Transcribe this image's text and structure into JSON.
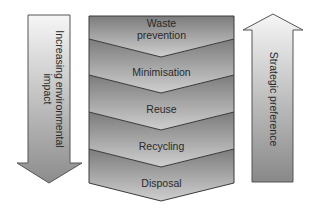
{
  "left_arrow": {
    "direction": "down",
    "label_line1": "Increasing environmental",
    "label_line2": "impact",
    "gradient": [
      "#f6f6f6",
      "#8c8c8c"
    ],
    "stroke": "#555555"
  },
  "right_arrow": {
    "direction": "up",
    "label": "Strategic preference",
    "gradient": [
      "#f6f6f6",
      "#888888"
    ],
    "stroke": "#555555"
  },
  "hierarchy": {
    "stroke": "#3a3a3a",
    "band_gradient": [
      "#7c7c7c",
      "#cfcfcf"
    ],
    "bands": [
      {
        "line1": "Waste",
        "line2": "prevention"
      },
      {
        "line1": "Minimisation"
      },
      {
        "line1": "Reuse"
      },
      {
        "line1": "Recycling"
      },
      {
        "line1": "Disposal"
      }
    ]
  }
}
